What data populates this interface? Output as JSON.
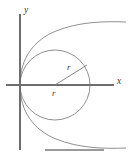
{
  "figure": {
    "background_color": "#ffffff",
    "stroke_color": "#8a8a8a",
    "axis_color": "#6e6e6e",
    "label_color": "#3a3a3a"
  },
  "axes": {
    "x_label": "x",
    "y_label": "y",
    "origin": {
      "x": 20,
      "y": 85
    },
    "x_axis": {
      "x1": 6,
      "y1": 85,
      "x2": 114,
      "y2": 85
    },
    "y_axis": {
      "x1": 20,
      "y1": 14,
      "x2": 20,
      "y2": 150
    }
  },
  "circle": {
    "center_x": 55,
    "center_y": 85,
    "radius": 35,
    "tangent_point": "origin"
  },
  "radius_markers": [
    {
      "label": "r",
      "label_x": 67,
      "label_y": 69,
      "from_x": 55,
      "from_y": 85,
      "to_x": 87,
      "to_y": 65
    },
    {
      "label": "r",
      "label_x": 53,
      "label_y": 95,
      "from_x": 55,
      "from_y": 85,
      "to_x": 55,
      "to_y": 85
    }
  ],
  "outer_curve": {
    "description": "parabola opening rightward, vertex at origin",
    "upper_end": {
      "x": 126,
      "y": 22
    },
    "lower_end": {
      "x": 126,
      "y": 148
    },
    "vertex": {
      "x": 20,
      "y": 85
    }
  },
  "bottom_rule": {
    "x1": 45,
    "y1": 150,
    "x2": 104,
    "y2": 150
  }
}
